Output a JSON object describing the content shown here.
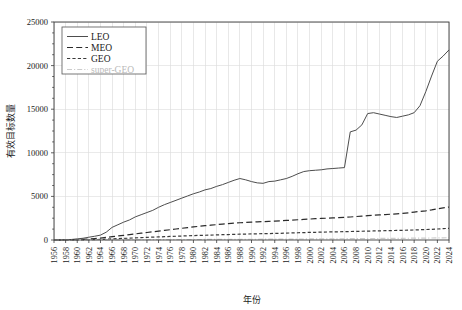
{
  "chart_data": {
    "type": "line",
    "title": "",
    "xlabel": "年份",
    "ylabel": "有效目标数量",
    "xlim": [
      1956,
      2024
    ],
    "ylim": [
      0,
      25000
    ],
    "grid": true,
    "legend_position": "top-left",
    "y_ticks": [
      0,
      5000,
      10000,
      15000,
      20000,
      25000
    ],
    "x_ticks": [
      1956,
      1958,
      1960,
      1962,
      1964,
      1966,
      1968,
      1970,
      1972,
      1974,
      1976,
      1978,
      1980,
      1982,
      1984,
      1986,
      1988,
      1990,
      1992,
      1994,
      1996,
      1998,
      2000,
      2002,
      2004,
      2006,
      2008,
      2010,
      2012,
      2014,
      2016,
      2018,
      2020,
      2022,
      2024
    ],
    "x": [
      1956,
      1957,
      1958,
      1959,
      1960,
      1961,
      1962,
      1963,
      1964,
      1965,
      1966,
      1967,
      1968,
      1969,
      1970,
      1971,
      1972,
      1973,
      1974,
      1975,
      1976,
      1977,
      1978,
      1979,
      1980,
      1981,
      1982,
      1983,
      1984,
      1985,
      1986,
      1987,
      1988,
      1989,
      1990,
      1991,
      1992,
      1993,
      1994,
      1995,
      1996,
      1997,
      1998,
      1999,
      2000,
      2001,
      2002,
      2003,
      2004,
      2005,
      2006,
      2007,
      2008,
      2009,
      2010,
      2011,
      2012,
      2013,
      2014,
      2015,
      2016,
      2017,
      2018,
      2019,
      2020,
      2021,
      2022,
      2023,
      2024
    ],
    "series": [
      {
        "name": "LEO",
        "style": "solid",
        "color": "#4d4d4d",
        "values": [
          0,
          0,
          20,
          60,
          130,
          200,
          320,
          430,
          560,
          900,
          1450,
          1750,
          2050,
          2300,
          2650,
          2900,
          3150,
          3400,
          3750,
          4050,
          4300,
          4550,
          4800,
          5050,
          5300,
          5500,
          5750,
          5900,
          6150,
          6350,
          6600,
          6850,
          7050,
          6900,
          6700,
          6550,
          6500,
          6700,
          6750,
          6900,
          7050,
          7300,
          7600,
          7850,
          7950,
          8000,
          8050,
          8150,
          8200,
          8250,
          8300,
          12400,
          12600,
          13200,
          14500,
          14600,
          14450,
          14300,
          14150,
          14050,
          14200,
          14350,
          14600,
          15400,
          17000,
          18800,
          20500,
          21100,
          21800
        ]
      },
      {
        "name": "MEO",
        "style": "dashed",
        "color": "#2b2b2b",
        "values": [
          0,
          0,
          5,
          15,
          40,
          70,
          110,
          160,
          220,
          300,
          380,
          460,
          540,
          620,
          700,
          780,
          860,
          940,
          1020,
          1100,
          1180,
          1260,
          1340,
          1420,
          1500,
          1570,
          1640,
          1700,
          1760,
          1820,
          1880,
          1930,
          1980,
          2020,
          2050,
          2080,
          2110,
          2140,
          2170,
          2200,
          2240,
          2280,
          2320,
          2360,
          2400,
          2440,
          2470,
          2500,
          2530,
          2560,
          2600,
          2640,
          2690,
          2740,
          2790,
          2840,
          2880,
          2920,
          2960,
          3000,
          3050,
          3120,
          3200,
          3280,
          3350,
          3450,
          3580,
          3680,
          3780
        ]
      },
      {
        "name": "GEO",
        "style": "dotted-dash",
        "color": "#3a3a3a",
        "values": [
          0,
          0,
          2,
          5,
          12,
          20,
          35,
          50,
          70,
          95,
          125,
          155,
          185,
          215,
          245,
          275,
          305,
          330,
          355,
          380,
          405,
          430,
          455,
          480,
          505,
          525,
          545,
          565,
          585,
          605,
          625,
          645,
          665,
          680,
          695,
          710,
          725,
          740,
          755,
          770,
          790,
          810,
          830,
          850,
          870,
          885,
          900,
          915,
          930,
          945,
          960,
          975,
          990,
          1005,
          1020,
          1035,
          1050,
          1065,
          1080,
          1095,
          1110,
          1130,
          1150,
          1175,
          1200,
          1225,
          1260,
          1300,
          1340
        ]
      },
      {
        "name": "super-GEO",
        "style": "dashdot",
        "color": "#cccccc",
        "values": [
          0,
          0,
          0,
          0,
          1,
          2,
          3,
          5,
          7,
          10,
          13,
          16,
          19,
          22,
          25,
          28,
          31,
          34,
          37,
          40,
          43,
          46,
          49,
          52,
          55,
          58,
          61,
          64,
          67,
          70,
          73,
          76,
          79,
          82,
          85,
          88,
          91,
          94,
          97,
          100,
          104,
          108,
          112,
          116,
          120,
          124,
          128,
          132,
          136,
          140,
          145,
          150,
          155,
          160,
          165,
          170,
          175,
          180,
          185,
          190,
          196,
          202,
          208,
          215,
          222,
          230,
          240,
          250,
          260
        ]
      }
    ]
  },
  "legend": {
    "items": [
      {
        "label": "LEO"
      },
      {
        "label": "MEO"
      },
      {
        "label": "GEO"
      },
      {
        "label": "super-GEO"
      }
    ]
  },
  "colors": {
    "axis": "#3a3a3a",
    "grid": "#d8d8d8",
    "leo": "#4d4d4d",
    "meo": "#2b2b2b",
    "geo": "#3a3a3a",
    "super_geo": "#cccccc",
    "background": "#ffffff"
  }
}
